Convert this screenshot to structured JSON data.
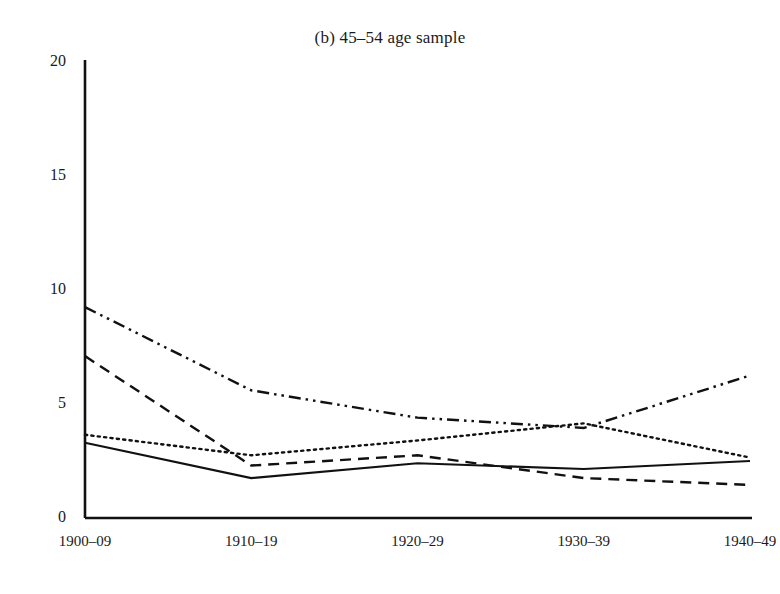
{
  "chart_data": {
    "type": "line",
    "title": "(b) 45–54 age sample",
    "xlabel": "",
    "ylabel": "",
    "categories": [
      "1900–09",
      "1910–19",
      "1920–29",
      "1930–39",
      "1940–49"
    ],
    "yticks": [
      "0",
      "5",
      "10",
      "15",
      "20"
    ],
    "ytick_values": [
      0,
      5,
      10,
      15,
      20
    ],
    "ylim": [
      0,
      20
    ],
    "grid": false,
    "legend": "none",
    "axis_style": "left-and-bottom-spines",
    "line_color": "#111111",
    "series": [
      {
        "name": "solid-series",
        "style": "solid",
        "dasharray": "",
        "width": 2.1,
        "values": [
          3.3,
          1.75,
          2.4,
          2.15,
          2.5
        ]
      },
      {
        "name": "dotted-series",
        "style": "dotted",
        "dasharray": "2.2 4.2",
        "width": 2.4,
        "values": [
          3.65,
          2.75,
          3.4,
          4.15,
          2.65
        ]
      },
      {
        "name": "dashed-series",
        "style": "dashed",
        "dasharray": "11 7",
        "width": 2.4,
        "values": [
          7.1,
          2.3,
          2.75,
          1.75,
          1.45
        ]
      },
      {
        "name": "dash-dot-dot-series",
        "style": "dash-dot-dot",
        "dasharray": "12 5 2.5 5 2.5 5",
        "width": 2.4,
        "values": [
          9.25,
          5.6,
          4.4,
          3.95,
          6.25
        ]
      }
    ]
  }
}
